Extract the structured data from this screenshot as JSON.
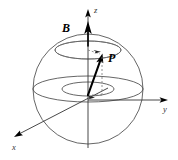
{
  "figure": {
    "background_color": "#ffffff",
    "width": 178,
    "height": 160
  },
  "labels": {
    "field_vector": "B",
    "polarization_vector": "P",
    "axis_z": "z",
    "axis_y": "y",
    "axis_x": "x"
  },
  "colors": {
    "outline": "#555555",
    "ellipse": "#4a4a4a",
    "axis": "#333333",
    "dashed": "#777777",
    "vector": "#000000",
    "text": "#000000"
  },
  "geometry": {
    "sphere_center_x": 88,
    "sphere_center_y": 89,
    "sphere_radius": 55,
    "equator_ry": 13,
    "inner_ellipse_rx": 26,
    "inner_ellipse_ry": 7,
    "upper_ellipse_cy": 50,
    "upper_ellipse_rx": 33,
    "upper_ellipse_ry": 9,
    "p_tip_x": 102,
    "p_tip_y": 56,
    "z_arrow_tip_y": 10,
    "y_arrow_tip_x": 168,
    "x_arrow_tip_x": 14,
    "x_arrow_tip_y": 137
  }
}
